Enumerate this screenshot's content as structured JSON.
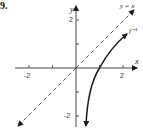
{
  "problem_number": "9.",
  "axes": {
    "x_label": "x",
    "y_label": "y",
    "x_ticks": [
      "-2",
      "2"
    ],
    "y_ticks": [
      "2",
      "-2"
    ]
  },
  "curves": [
    {
      "name": "y = x",
      "label": "y = x",
      "style": "dashed",
      "arrows": "both"
    },
    {
      "name": "f inverse",
      "label": "f⁻¹",
      "style": "solid",
      "arrows": "both"
    }
  ],
  "colors": {
    "stroke": "#1a1a1a",
    "dash": "#444444"
  }
}
